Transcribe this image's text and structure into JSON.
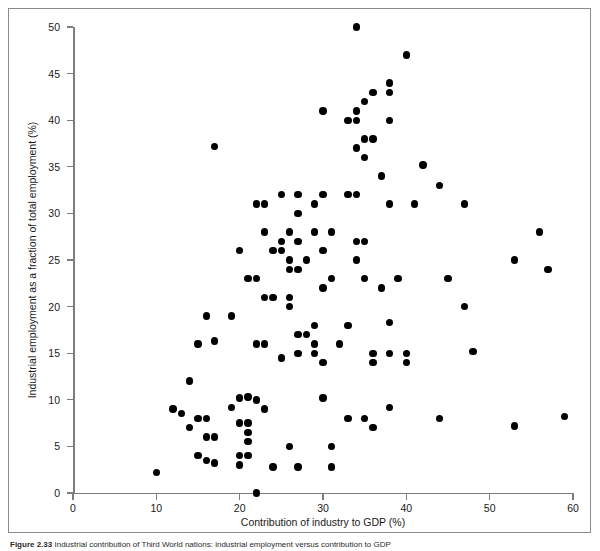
{
  "figure": {
    "caption_label": "Figure 2.33",
    "caption_text": "Industrial contribution of Third World nations: industrial employment versus contribution to GDP"
  },
  "chart_data": {
    "type": "scatter",
    "title": "",
    "xlabel": "Contribution of industry to GDP (%)",
    "ylabel": "Industrial employment as a fraction of total employment (%)",
    "xlim": [
      0,
      60
    ],
    "ylim": [
      0,
      50
    ],
    "xticks": [
      0,
      10,
      20,
      30,
      40,
      50,
      60
    ],
    "yticks": [
      0,
      5,
      10,
      15,
      20,
      25,
      30,
      35,
      40,
      45,
      50
    ],
    "grid": false,
    "legend": null,
    "marker": "filled-circle",
    "marker_color": "#000000",
    "points": [
      [
        34,
        50
      ],
      [
        40,
        47
      ],
      [
        38,
        44
      ],
      [
        38,
        43
      ],
      [
        36,
        43
      ],
      [
        35,
        42
      ],
      [
        34,
        41
      ],
      [
        30,
        41
      ],
      [
        34,
        40
      ],
      [
        38,
        40
      ],
      [
        33,
        40
      ],
      [
        17,
        37.2
      ],
      [
        35,
        38
      ],
      [
        36,
        38
      ],
      [
        34,
        37
      ],
      [
        35,
        36
      ],
      [
        42,
        35.2
      ],
      [
        37,
        34
      ],
      [
        44,
        33
      ],
      [
        34,
        32
      ],
      [
        33,
        32
      ],
      [
        30,
        32
      ],
      [
        25,
        32
      ],
      [
        27,
        32
      ],
      [
        23,
        31
      ],
      [
        38,
        31
      ],
      [
        47,
        31
      ],
      [
        41,
        31
      ],
      [
        29,
        31
      ],
      [
        22,
        31
      ],
      [
        27,
        30
      ],
      [
        23,
        28
      ],
      [
        26,
        28
      ],
      [
        56,
        28
      ],
      [
        31,
        28
      ],
      [
        29,
        28
      ],
      [
        34,
        27
      ],
      [
        35,
        27
      ],
      [
        53,
        25
      ],
      [
        25,
        27
      ],
      [
        27,
        27
      ],
      [
        25,
        26
      ],
      [
        24,
        26
      ],
      [
        20,
        26
      ],
      [
        57,
        24
      ],
      [
        30,
        26
      ],
      [
        28,
        25
      ],
      [
        34,
        25
      ],
      [
        26,
        25
      ],
      [
        26,
        24
      ],
      [
        27,
        24
      ],
      [
        45,
        23
      ],
      [
        21,
        23
      ],
      [
        22,
        23
      ],
      [
        31,
        23
      ],
      [
        35,
        23
      ],
      [
        39,
        23
      ],
      [
        30,
        22
      ],
      [
        37,
        22
      ],
      [
        26,
        21
      ],
      [
        23,
        21
      ],
      [
        24,
        21
      ],
      [
        26,
        20
      ],
      [
        47,
        20
      ],
      [
        16,
        19
      ],
      [
        19,
        19
      ],
      [
        29,
        18
      ],
      [
        33,
        18
      ],
      [
        38,
        18.3
      ],
      [
        27,
        17
      ],
      [
        28,
        17
      ],
      [
        15,
        16
      ],
      [
        17,
        16.3
      ],
      [
        22,
        16
      ],
      [
        23,
        16
      ],
      [
        29,
        16
      ],
      [
        32,
        16
      ],
      [
        36,
        15
      ],
      [
        38,
        15
      ],
      [
        40,
        15
      ],
      [
        48,
        15.2
      ],
      [
        29,
        15
      ],
      [
        27,
        15
      ],
      [
        25,
        14.5
      ],
      [
        30,
        14
      ],
      [
        36,
        14
      ],
      [
        40,
        14
      ],
      [
        14,
        12
      ],
      [
        20,
        10.2
      ],
      [
        21,
        10.3
      ],
      [
        22,
        10
      ],
      [
        30,
        10.2
      ],
      [
        19,
        9.2
      ],
      [
        23,
        9
      ],
      [
        38,
        9.2
      ],
      [
        12,
        9
      ],
      [
        13,
        8.5
      ],
      [
        15,
        8
      ],
      [
        16,
        8
      ],
      [
        33,
        8
      ],
      [
        59,
        8.2
      ],
      [
        35,
        8
      ],
      [
        44,
        8
      ],
      [
        20,
        7.5
      ],
      [
        21,
        7.5
      ],
      [
        14,
        7
      ],
      [
        53,
        7.2
      ],
      [
        36,
        7
      ],
      [
        21,
        6.5
      ],
      [
        17,
        6
      ],
      [
        16,
        6
      ],
      [
        21,
        5.5
      ],
      [
        26,
        5
      ],
      [
        31,
        5
      ],
      [
        15,
        4
      ],
      [
        20,
        4
      ],
      [
        21,
        4
      ],
      [
        16,
        3.5
      ],
      [
        17,
        3.2
      ],
      [
        20,
        3
      ],
      [
        24,
        2.8
      ],
      [
        27,
        2.8
      ],
      [
        31,
        2.8
      ],
      [
        10,
        2.2
      ],
      [
        22,
        0
      ]
    ]
  }
}
